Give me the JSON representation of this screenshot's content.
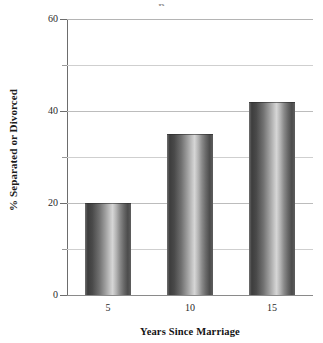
{
  "chart_data": {
    "type": "bar",
    "title": "",
    "title_remnant": "p",
    "xlabel": "Years Since Marriage",
    "ylabel": "% Separated or Divorced",
    "categories": [
      "5",
      "10",
      "15"
    ],
    "values": [
      20,
      35,
      42
    ],
    "ylim": [
      0,
      60
    ],
    "ytick_labels": [
      "0",
      "20",
      "40",
      "60"
    ],
    "ytick_values": [
      0,
      20,
      40,
      60
    ],
    "minor_tick_values": [
      10,
      30,
      50
    ],
    "gridlines": [
      10,
      20,
      30,
      40,
      50,
      60
    ],
    "grid": true,
    "legend": "none",
    "series": [
      {
        "name": "% Separated or Divorced",
        "values": [
          20,
          35,
          42
        ]
      }
    ],
    "bar_fill": "#7a7a7a",
    "grid_color": "#cfcfcf",
    "axis_color": "#6d6d6d",
    "text_color": "#1c1c1c"
  }
}
